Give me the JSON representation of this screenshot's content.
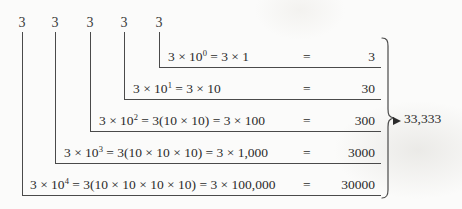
{
  "figure": {
    "top_digits": [
      "3",
      "3",
      "3",
      "3",
      "3"
    ],
    "total": "33,333",
    "ink_color": "#2b2b2b",
    "line_color": "#4a4a4a",
    "background_color": "#fbfbfa"
  },
  "rows": [
    {
      "expression": "3 × 10",
      "exponent": "0",
      "expansion": " = 3 × 1",
      "equals": "=",
      "result": "3"
    },
    {
      "expression": "3 × 10",
      "exponent": "1",
      "expansion": " = 3 × 10",
      "equals": "=",
      "result": "30"
    },
    {
      "expression": "3 × 10",
      "exponent": "2",
      "expansion": " = 3(10 × 10) = 3 × 100",
      "equals": "=",
      "result": "300"
    },
    {
      "expression": "3 × 10",
      "exponent": "3",
      "expansion": " = 3(10 × 10 × 10) = 3 × 1,000",
      "equals": "=",
      "result": "3000"
    },
    {
      "expression": "3 × 10",
      "exponent": "4",
      "expansion": " = 3(10 × 10 × 10 × 10) = 3 × 100,000",
      "equals": "=",
      "result": "30000"
    }
  ]
}
